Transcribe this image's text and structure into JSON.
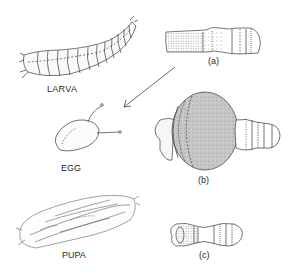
{
  "figure": {
    "stages": [
      {
        "id": "larva",
        "label": "LARVA"
      },
      {
        "id": "egg",
        "label": "EGG"
      },
      {
        "id": "pupa",
        "label": "PUPA"
      }
    ],
    "variants": [
      {
        "id": "a",
        "label": "(a)"
      },
      {
        "id": "b",
        "label": "(b)"
      },
      {
        "id": "c",
        "label": "(c)"
      }
    ],
    "arrow": {
      "from": "variant-a",
      "to": "egg",
      "direction": "down-left"
    },
    "colors": {
      "line": "#3a3a3a",
      "shade_gray": "#c8c8c8",
      "background": "#ffffff"
    }
  }
}
